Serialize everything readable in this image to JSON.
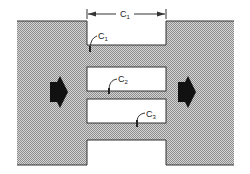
{
  "diagram": {
    "dimension_label": {
      "main": "C",
      "sub": "1"
    },
    "labels": [
      {
        "id": "c1",
        "main": "C",
        "sub": "1"
      },
      {
        "id": "c2",
        "main": "C",
        "sub": "2"
      },
      {
        "id": "c3",
        "main": "C",
        "sub": "3"
      }
    ],
    "flow_arrows": [
      "left-flow-arrow",
      "right-flow-arrow"
    ],
    "colors": {
      "fill": "#b9b9b9",
      "stroke": "#333333",
      "arrow": "#111111"
    }
  }
}
